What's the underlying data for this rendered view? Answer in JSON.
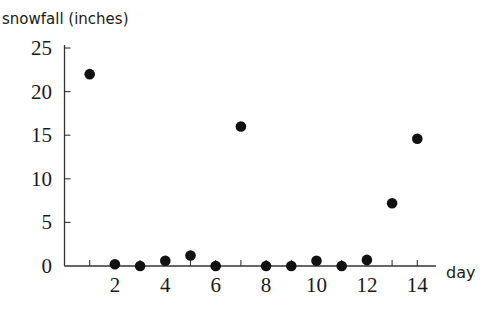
{
  "chart_data": {
    "type": "scatter",
    "title": "",
    "ylabel": "snowfall (inches)",
    "xlabel": "day",
    "xlim": [
      0,
      15
    ],
    "ylim": [
      0,
      25
    ],
    "x_ticks": [
      1,
      2,
      3,
      4,
      5,
      6,
      7,
      8,
      9,
      10,
      11,
      12,
      13,
      14
    ],
    "x_tick_labels": [
      "2",
      "4",
      "6",
      "8",
      "10",
      "12",
      "14"
    ],
    "x_tick_label_values": [
      2,
      4,
      6,
      8,
      10,
      12,
      14
    ],
    "y_ticks": [
      0,
      5,
      10,
      15,
      20,
      25
    ],
    "y_tick_labels": [
      "0",
      "5",
      "10",
      "15",
      "20",
      "25"
    ],
    "grid": false,
    "legend": null,
    "series": [
      {
        "name": "snowfall",
        "x": [
          1,
          2,
          3,
          4,
          5,
          6,
          7,
          8,
          9,
          10,
          11,
          12,
          13,
          14
        ],
        "y": [
          22,
          0.2,
          0,
          0.6,
          1.2,
          0,
          16,
          0,
          0,
          0.6,
          0,
          0.7,
          7.2,
          14.6
        ]
      }
    ],
    "colors": {
      "points": "#111111",
      "axis": "#333333"
    }
  }
}
